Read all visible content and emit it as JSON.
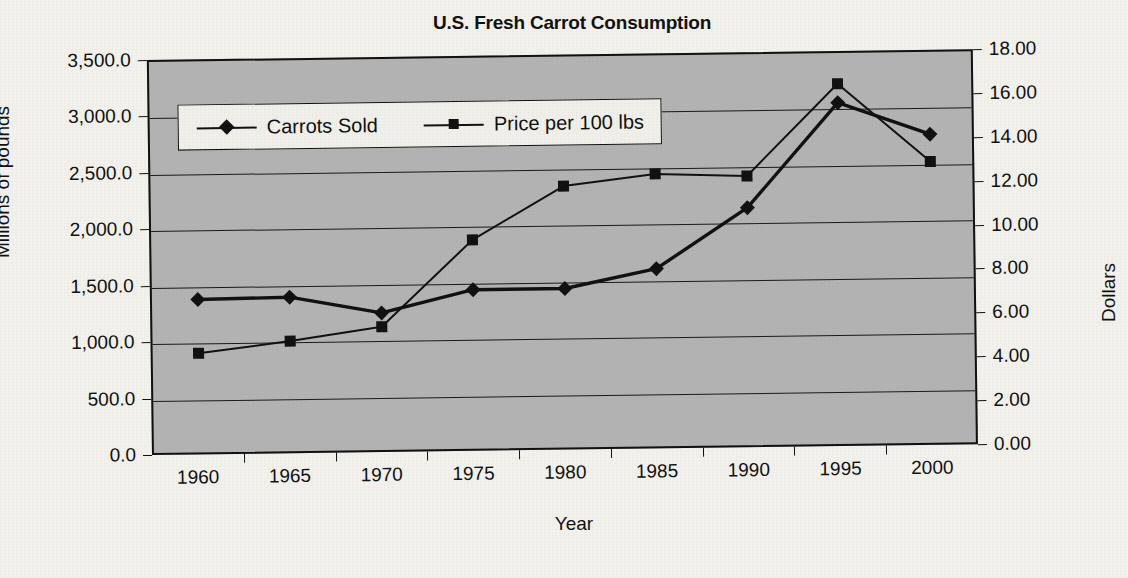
{
  "chart_data": {
    "type": "line",
    "title": "U.S. Fresh Carrot Consumption",
    "xlabel": "Year",
    "ylabel": "Millions of pounds",
    "y2label": "Dollars",
    "categories": [
      "1960",
      "1965",
      "1970",
      "1975",
      "1980",
      "1985",
      "1990",
      "1995",
      "2000"
    ],
    "x": [
      1960,
      1965,
      1970,
      1975,
      1980,
      1985,
      1990,
      1995,
      2000
    ],
    "series": [
      {
        "name": "Carrots Sold",
        "axis": "left",
        "marker": "diamond",
        "values": [
          1390.0,
          1400.0,
          1250.0,
          1445.0,
          1445.0,
          1610.0,
          2140.0,
          3060.0,
          2770.0
        ]
      },
      {
        "name": "Price per 100 lbs",
        "axis": "right",
        "marker": "square",
        "values": [
          4.7,
          5.2,
          5.8,
          9.7,
          12.1,
          12.6,
          12.45,
          16.6,
          13.0
        ]
      }
    ],
    "ylim": [
      0,
      3500
    ],
    "ytick_step": 500,
    "ytick_labels": [
      "3,500.0",
      "3,000.0",
      "2,500.0",
      "2,000.0",
      "1,500.0",
      "1,000.0",
      "500.0",
      "0.0"
    ],
    "y2lim": [
      0,
      18
    ],
    "y2tick_step": 2,
    "y2tick_labels": [
      "18.00",
      "16.00",
      "14.00",
      "12.00",
      "10.00",
      "8.00",
      "6.00",
      "4.00",
      "2.00",
      "0.00"
    ],
    "grid": true,
    "grid_axis": "y-left",
    "legend_position": "inside-top-left",
    "plot_background": "#b3b3b3",
    "line_color": "#111111",
    "page_background": "#f2f1ec"
  }
}
